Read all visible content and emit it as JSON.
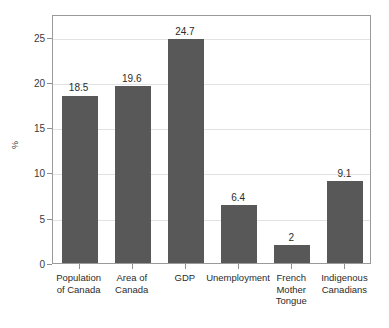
{
  "chart_data": {
    "type": "bar",
    "title": "",
    "subtitle": "",
    "xlabel": "",
    "ylabel": "%",
    "categories": [
      "Population\nof Canada",
      "Area of\nCanada",
      "GDP",
      "Unemployment",
      "French\nMother\nTongue",
      "Indigenous\nCanadians"
    ],
    "values": [
      18.5,
      19.6,
      24.7,
      6.4,
      2,
      9.1
    ],
    "value_labels": [
      "18.5",
      "19.6",
      "24.7",
      "6.4",
      "2",
      "9.1"
    ],
    "ylim": [
      0,
      27.5
    ],
    "yticks": [
      0,
      5,
      10,
      15,
      20,
      25
    ],
    "ytick_labels": [
      "0",
      "5",
      "10",
      "15",
      "20",
      "25"
    ],
    "grid": true,
    "legend": null,
    "bar_color": "#585858",
    "grid_color": "#e2e2e2",
    "frame_color": "#9a9a9a",
    "text_color": "#2b2b2b",
    "background": "#ffffff"
  }
}
